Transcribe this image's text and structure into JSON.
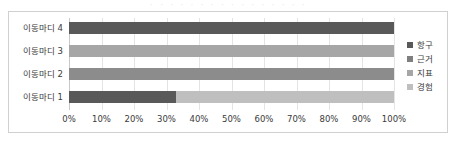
{
  "top_remnant_text": "· · · · · · · · · · · · · · · ·",
  "chart_data": {
    "type": "bar",
    "orientation": "horizontal",
    "stacked": "100%",
    "title": "",
    "xlabel": "",
    "ylabel": "",
    "xlim": [
      0,
      100
    ],
    "grid": true,
    "legend_position": "right",
    "categories": [
      "이동마디 1",
      "이동마디 2",
      "이동마디 3",
      "이동마디 4"
    ],
    "series": [
      {
        "name": "항구",
        "color": "#595959",
        "values": [
          33,
          0,
          0,
          100
        ]
      },
      {
        "name": "근거",
        "color": "#7f7f7f",
        "values": [
          0,
          100,
          0,
          0
        ]
      },
      {
        "name": "지표",
        "color": "#a6a6a6",
        "values": [
          0,
          0,
          100,
          0
        ]
      },
      {
        "name": "경험",
        "color": "#bfbfbf",
        "values": [
          67,
          0,
          0,
          0
        ]
      }
    ],
    "xticks": [
      "0%",
      "10%",
      "20%",
      "30%",
      "40%",
      "50%",
      "60%",
      "70%",
      "80%",
      "90%",
      "100%"
    ],
    "xtick_values": [
      0,
      10,
      20,
      30,
      40,
      50,
      60,
      70,
      80,
      90,
      100
    ],
    "rows_top_to_bottom": [
      {
        "category": "이동마디 4",
        "segments": [
          {
            "series": "항구",
            "value": 100,
            "color": "#595959"
          }
        ]
      },
      {
        "category": "이동마디 3",
        "segments": [
          {
            "series": "지표",
            "value": 100,
            "color": "#a6a6a6"
          }
        ]
      },
      {
        "category": "이동마디 2",
        "segments": [
          {
            "series": "근거",
            "value": 100,
            "color": "#8c8c8c"
          }
        ]
      },
      {
        "category": "이동마디 1",
        "segments": [
          {
            "series": "항구",
            "value": 33,
            "color": "#595959"
          },
          {
            "series": "경험",
            "value": 67,
            "color": "#bfbfbf"
          }
        ]
      }
    ],
    "legend": [
      {
        "label": "항구",
        "color": "#595959"
      },
      {
        "label": "근거",
        "color": "#7f7f7f"
      },
      {
        "label": "지표",
        "color": "#a6a6a6"
      },
      {
        "label": "경험",
        "color": "#bfbfbf"
      }
    ]
  },
  "style": {
    "frame_color": "#d0d0d0",
    "gridline_color": "#e4e4e4",
    "axis_color": "#c8c8c8",
    "text_color": "#3a3a3a",
    "background": "#ffffff"
  }
}
